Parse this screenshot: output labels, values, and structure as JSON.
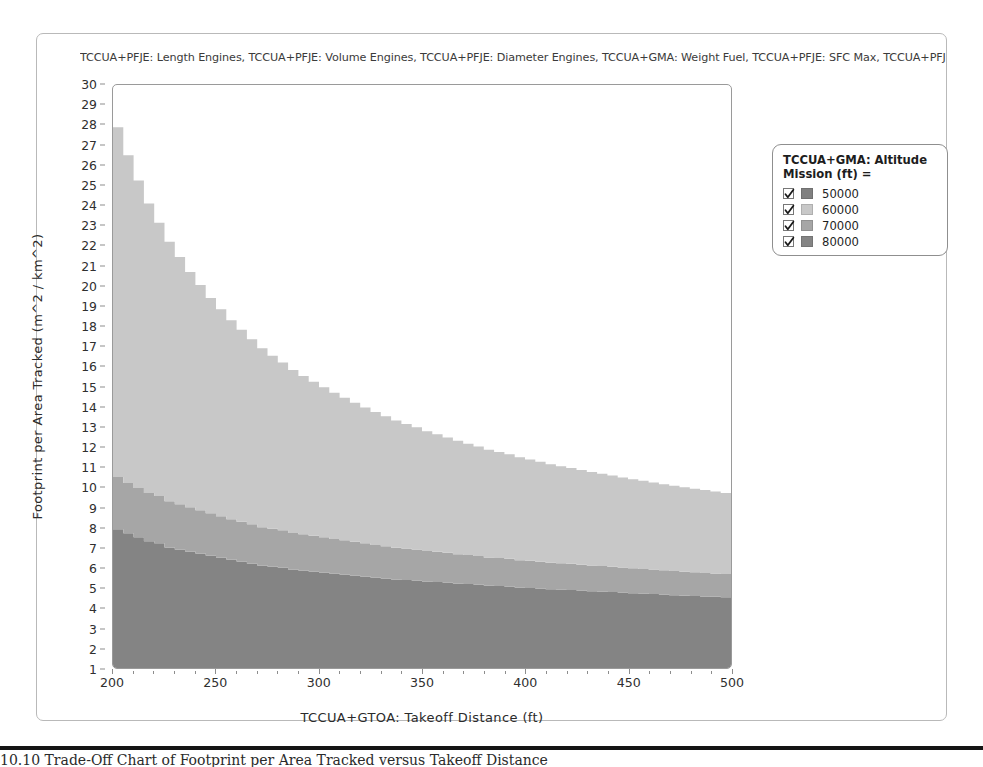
{
  "figure": {
    "title": "TCCUA+PFJE: Length Engines, TCCUA+PFJE: Volume Engines, TCCUA+PFJE: Diameter Engines, TCCUA+GMA: Weight Fuel, TCCUA+PFJE: SFC Max, TCCUA+PFJE: S",
    "bottom_caption": "10.10    Trade-Off Chart of Footprint per Area Tracked versus Takeoff Distance"
  },
  "legend": {
    "title": "TCCUA+GMA: Altitude Mission (ft) =",
    "check_icon": "check-icon",
    "items": [
      {
        "label": "50000",
        "color": "#808080",
        "checked": true
      },
      {
        "label": "60000",
        "color": "#c8c8c8",
        "checked": true
      },
      {
        "label": "70000",
        "color": "#a6a6a6",
        "checked": true
      },
      {
        "label": "80000",
        "color": "#848484",
        "checked": true
      }
    ]
  },
  "chart_data": {
    "type": "area",
    "title": "TCCUA+PFJE: Length Engines, TCCUA+PFJE: Volume Engines, TCCUA+PFJE: Diameter Engines, TCCUA+GMA: Weight Fuel, TCCUA+PFJE: SFC Max, TCCUA+PFJE: S",
    "xlabel": "TCCUA+GTOA: Takeoff Distance (ft)",
    "ylabel": "Footprint per Area Tracked (m^2 / km^2)",
    "xlim": [
      200,
      500
    ],
    "ylim": [
      1,
      30
    ],
    "xticks": [
      200,
      250,
      300,
      350,
      400,
      450,
      500
    ],
    "yticks": [
      1,
      2,
      3,
      4,
      5,
      6,
      7,
      8,
      9,
      10,
      11,
      12,
      13,
      14,
      15,
      16,
      17,
      18,
      19,
      20,
      21,
      22,
      23,
      24,
      25,
      26,
      27,
      28,
      29,
      30
    ],
    "grid": false,
    "legend_position": "right",
    "stacked": true,
    "x": [
      200,
      205,
      210,
      215,
      220,
      225,
      230,
      235,
      240,
      245,
      250,
      255,
      260,
      265,
      270,
      275,
      280,
      285,
      290,
      295,
      300,
      305,
      310,
      315,
      320,
      325,
      330,
      335,
      340,
      345,
      350,
      355,
      360,
      365,
      370,
      375,
      380,
      385,
      390,
      395,
      400,
      405,
      410,
      415,
      420,
      425,
      430,
      435,
      440,
      445,
      450,
      455,
      460,
      465,
      470,
      475,
      480,
      485,
      490,
      495,
      500
    ],
    "series": [
      {
        "name": "80000",
        "color": "#848484",
        "values": [
          6.9,
          6.7,
          6.5,
          6.3,
          6.2,
          6.0,
          5.9,
          5.8,
          5.7,
          5.6,
          5.5,
          5.4,
          5.3,
          5.2,
          5.1,
          5.05,
          5.0,
          4.9,
          4.85,
          4.8,
          4.75,
          4.7,
          4.65,
          4.6,
          4.55,
          4.5,
          4.45,
          4.4,
          4.38,
          4.35,
          4.3,
          4.28,
          4.25,
          4.2,
          4.18,
          4.15,
          4.1,
          4.08,
          4.05,
          4.0,
          3.98,
          3.95,
          3.92,
          3.9,
          3.88,
          3.85,
          3.82,
          3.8,
          3.78,
          3.75,
          3.72,
          3.7,
          3.68,
          3.65,
          3.62,
          3.6,
          3.58,
          3.56,
          3.54,
          3.52,
          3.5
        ]
      },
      {
        "name": "70000",
        "color": "#a6a6a6",
        "values": [
          2.6,
          2.5,
          2.45,
          2.4,
          2.35,
          2.3,
          2.25,
          2.2,
          2.15,
          2.1,
          2.05,
          2.0,
          1.98,
          1.95,
          1.9,
          1.88,
          1.85,
          1.82,
          1.8,
          1.78,
          1.75,
          1.72,
          1.7,
          1.68,
          1.65,
          1.62,
          1.6,
          1.58,
          1.56,
          1.54,
          1.52,
          1.5,
          1.48,
          1.46,
          1.44,
          1.42,
          1.4,
          1.39,
          1.38,
          1.36,
          1.35,
          1.34,
          1.32,
          1.31,
          1.3,
          1.29,
          1.28,
          1.27,
          1.26,
          1.25,
          1.24,
          1.23,
          1.22,
          1.21,
          1.2,
          1.19,
          1.18,
          1.17,
          1.16,
          1.15,
          1.14
        ]
      },
      {
        "name": "60000",
        "color": "#c8c8c8",
        "values": [
          17.4,
          16.3,
          15.3,
          14.4,
          13.6,
          12.9,
          12.3,
          11.7,
          11.2,
          10.7,
          10.3,
          9.9,
          9.55,
          9.2,
          8.9,
          8.6,
          8.35,
          8.1,
          7.88,
          7.66,
          7.46,
          7.27,
          7.09,
          6.92,
          6.76,
          6.61,
          6.47,
          6.33,
          6.2,
          6.08,
          5.96,
          5.85,
          5.74,
          5.64,
          5.54,
          5.45,
          5.36,
          5.28,
          5.2,
          5.12,
          5.04,
          4.97,
          4.9,
          4.83,
          4.77,
          4.71,
          4.65,
          4.59,
          4.53,
          4.48,
          4.43,
          4.38,
          4.33,
          4.28,
          4.24,
          4.2,
          4.16,
          4.12,
          4.08,
          4.04,
          4.0
        ]
      },
      {
        "name": "50000",
        "color": "#808080",
        "values": [
          0,
          0,
          0,
          0,
          0,
          0,
          0,
          0,
          0,
          0,
          0,
          0,
          0,
          0,
          0,
          0,
          0,
          0,
          0,
          0,
          0,
          0,
          0,
          0,
          0,
          0,
          0,
          0,
          0,
          0,
          0,
          0,
          0,
          0,
          0,
          0,
          0,
          0,
          0,
          0,
          0,
          0,
          0,
          0,
          0,
          0,
          0,
          0,
          0,
          0,
          0,
          0,
          0,
          0,
          0,
          0,
          0,
          0,
          0,
          0,
          0
        ]
      }
    ]
  }
}
